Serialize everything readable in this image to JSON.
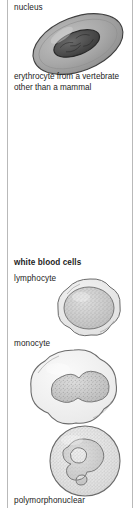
{
  "figure": {
    "kind": "biology-illustration-column",
    "background_color": "#ffffff",
    "rule_color": "#b9b9b9",
    "labels": {
      "nucleus": "nucleus",
      "erythrocyte_caption_line1": "erythrocyte from a vertebrate",
      "erythrocyte_caption_line2": "other than a mammal",
      "white_blood_cells_heading": "white blood cells",
      "lymphocyte": "lymphocyte",
      "monocyte": "monocyte",
      "polymorphonuclear": "polymorphonuclear"
    },
    "cells": [
      {
        "name": "erythrocyte",
        "description": "oval nucleated red blood cell of a non-mammalian vertebrate",
        "cytoplasm_color": "#a3a3a3",
        "nucleus_color": "#4a4a4a",
        "outline_color": "#3d3d3d"
      },
      {
        "name": "lymphocyte",
        "description": "small white blood cell with a large round stippled nucleus and thin cytoplasm rim",
        "cytoplasm_color": "#ececec",
        "nucleus_color": "#cfcfcf",
        "outline_color": "#6e6e6e"
      },
      {
        "name": "monocyte",
        "description": "large white blood cell with a kidney-shaped stippled nucleus and abundant pale cytoplasm",
        "cytoplasm_color": "#f2f2f2",
        "nucleus_color": "#cccccc",
        "outline_color": "#6e6e6e"
      },
      {
        "name": "polymorphonuclear",
        "description": "round granular white blood cell with a multi-lobed horseshoe nucleus",
        "cytoplasm_color": "#e8e8e8",
        "nucleus_color": "#d2d2d2",
        "outline_color": "#6e6e6e"
      }
    ]
  }
}
